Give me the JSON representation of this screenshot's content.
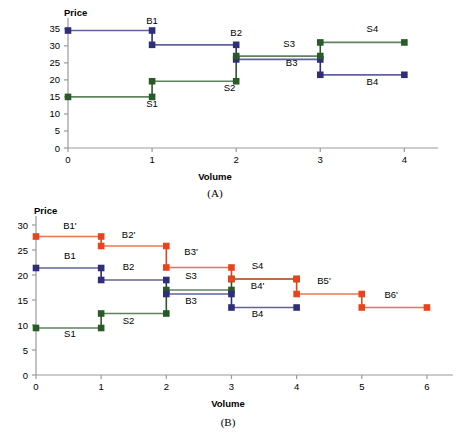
{
  "figure": {
    "title": "",
    "background": "#ffffff",
    "colors": {
      "blue": "#2e2e7a",
      "green": "#2a5a28",
      "orange": "#e8441c",
      "axis": "#9a9a9a",
      "grid_line_light": "#b9b9b9"
    }
  },
  "chart_data": [
    {
      "id": "A",
      "type": "line",
      "caption": "(A)",
      "title": "",
      "xlabel": "Volume",
      "ylabel": "Price",
      "xlim": [
        0,
        4.4
      ],
      "ylim": [
        0,
        37
      ],
      "xticks": [
        0,
        1,
        2,
        3,
        4
      ],
      "yticks": [
        0,
        5,
        10,
        15,
        20,
        25,
        30,
        35
      ],
      "xticklabels": [
        "0",
        "1",
        "2",
        "3",
        "4"
      ],
      "yticklabels": [
        "0",
        "5",
        "10",
        "15",
        "20",
        "25",
        "30",
        "35"
      ],
      "grid": false,
      "legend": "none",
      "series": [
        {
          "name": "B1",
          "color": "#2e2e7a",
          "label": "B1",
          "label_x": 1.0,
          "label_y": 36.5,
          "points": [
            {
              "x": 0,
              "y": 34.5
            },
            {
              "x": 1,
              "y": 34.5
            }
          ]
        },
        {
          "name": "S1",
          "color": "#2a5a28",
          "label": "S1",
          "label_x": 1.0,
          "label_y": 12.0,
          "points": [
            {
              "x": 0,
              "y": 15.0
            },
            {
              "x": 1,
              "y": 15.0
            }
          ]
        },
        {
          "name": "B2",
          "color": "#2e2e7a",
          "label": "B2",
          "label_x": 2.0,
          "label_y": 33.0,
          "points": [
            {
              "x": 1,
              "y": 30.3
            },
            {
              "x": 2,
              "y": 30.3
            }
          ]
        },
        {
          "name": "S2",
          "color": "#2a5a28",
          "label": "S2",
          "label_x": 1.92,
          "label_y": 16.6,
          "points": [
            {
              "x": 1,
              "y": 19.6
            },
            {
              "x": 2,
              "y": 19.6
            }
          ]
        },
        {
          "name": "B3",
          "color": "#2e2e7a",
          "label": "B3",
          "label_x": 2.66,
          "label_y": 24.0,
          "points": [
            {
              "x": 2,
              "y": 26.0
            },
            {
              "x": 3,
              "y": 26.0
            }
          ]
        },
        {
          "name": "S3",
          "color": "#2a5a28",
          "label": "S3",
          "label_x": 2.63,
          "label_y": 29.6,
          "points": [
            {
              "x": 2,
              "y": 27.0
            },
            {
              "x": 3,
              "y": 27.0
            }
          ]
        },
        {
          "name": "B4",
          "color": "#2e2e7a",
          "label": "B4",
          "label_x": 3.62,
          "label_y": 18.6,
          "points": [
            {
              "x": 3,
              "y": 21.5
            },
            {
              "x": 4,
              "y": 21.5
            }
          ]
        },
        {
          "name": "S4",
          "color": "#2a5a28",
          "label": "S4",
          "label_x": 3.62,
          "label_y": 34.0,
          "points": [
            {
              "x": 3,
              "y": 31.0
            },
            {
              "x": 4,
              "y": 31.0
            }
          ]
        }
      ],
      "connectors": [
        {
          "x": 1,
          "y0": 34.5,
          "y1": 30.3,
          "color": "#2e2e7a"
        },
        {
          "x": 1,
          "y0": 19.6,
          "y1": 15.0,
          "color": "#2a5a28"
        },
        {
          "x": 2,
          "y0": 30.3,
          "y1": 26.0,
          "color": "#2e2e7a"
        },
        {
          "x": 2,
          "y0": 27.0,
          "y1": 19.6,
          "color": "#2a5a28"
        },
        {
          "x": 3,
          "y0": 26.0,
          "y1": 21.5,
          "color": "#2e2e7a"
        },
        {
          "x": 3,
          "y0": 31.0,
          "y1": 27.0,
          "color": "#2a5a28"
        }
      ]
    },
    {
      "id": "B",
      "type": "line",
      "caption": "(B)",
      "title": "",
      "xlabel": "Volume",
      "ylabel": "Price",
      "xlim": [
        0,
        6.4
      ],
      "ylim": [
        0,
        31
      ],
      "xticks": [
        0,
        1,
        2,
        3,
        4,
        5,
        6
      ],
      "yticks": [
        0,
        5,
        10,
        15,
        20,
        25,
        30
      ],
      "xticklabels": [
        "0",
        "1",
        "2",
        "3",
        "4",
        "5",
        "6"
      ],
      "yticklabels": [
        "0",
        "5",
        "10",
        "15",
        "20",
        "25",
        "30"
      ],
      "grid": false,
      "legend": "none",
      "series": [
        {
          "name": "B1p",
          "color": "#e8441c",
          "label": "B1'",
          "label_x": 0.52,
          "label_y": 29.3,
          "points": [
            {
              "x": 0,
              "y": 27.7
            },
            {
              "x": 1,
              "y": 27.7
            }
          ]
        },
        {
          "name": "B1",
          "color": "#2e2e7a",
          "label": "B1",
          "label_x": 0.52,
          "label_y": 23.3,
          "points": [
            {
              "x": 0,
              "y": 21.4
            },
            {
              "x": 1,
              "y": 21.4
            }
          ]
        },
        {
          "name": "S1",
          "color": "#2a5a28",
          "label": "S1",
          "label_x": 0.52,
          "label_y": 7.6,
          "points": [
            {
              "x": 0,
              "y": 9.4
            },
            {
              "x": 1,
              "y": 9.4
            }
          ]
        },
        {
          "name": "B2p",
          "color": "#e8441c",
          "label": "B2'",
          "label_x": 1.42,
          "label_y": 27.4,
          "points": [
            {
              "x": 1,
              "y": 25.8
            },
            {
              "x": 2,
              "y": 25.8
            }
          ]
        },
        {
          "name": "B2",
          "color": "#2e2e7a",
          "label": "B2",
          "label_x": 1.42,
          "label_y": 21.0,
          "points": [
            {
              "x": 1,
              "y": 19.0
            },
            {
              "x": 2,
              "y": 19.0
            }
          ]
        },
        {
          "name": "S2",
          "color": "#2a5a28",
          "label": "S2",
          "label_x": 1.42,
          "label_y": 10.3,
          "points": [
            {
              "x": 1,
              "y": 12.3
            },
            {
              "x": 2,
              "y": 12.3
            }
          ]
        },
        {
          "name": "B3p",
          "color": "#e8441c",
          "label": "B3'",
          "label_x": 2.38,
          "label_y": 24.0,
          "points": [
            {
              "x": 2,
              "y": 21.5
            },
            {
              "x": 3,
              "y": 21.5
            }
          ]
        },
        {
          "name": "S3",
          "color": "#2a5a28",
          "label": "S3",
          "label_x": 2.38,
          "label_y": 19.3,
          "points": [
            {
              "x": 2,
              "y": 17.0
            },
            {
              "x": 3,
              "y": 17.0
            }
          ]
        },
        {
          "name": "B3",
          "color": "#2e2e7a",
          "label": "B3",
          "label_x": 2.38,
          "label_y": 14.2,
          "points": [
            {
              "x": 2,
              "y": 16.2
            },
            {
              "x": 3,
              "y": 16.2
            }
          ]
        },
        {
          "name": "S4",
          "color": "#2a5a28",
          "label": "S4",
          "label_x": 3.4,
          "label_y": 21.3,
          "points": [
            {
              "x": 3,
              "y": 19.2
            },
            {
              "x": 4,
              "y": 19.2
            }
          ]
        },
        {
          "name": "B4p",
          "color": "#e8441c",
          "label": "B4'",
          "label_x": 3.4,
          "label_y": 17.2,
          "points": [
            {
              "x": 3,
              "y": 19.2
            },
            {
              "x": 4,
              "y": 19.2
            }
          ]
        },
        {
          "name": "B4",
          "color": "#2e2e7a",
          "label": "B4",
          "label_x": 3.4,
          "label_y": 11.6,
          "points": [
            {
              "x": 3,
              "y": 13.5
            },
            {
              "x": 4,
              "y": 13.5
            }
          ]
        },
        {
          "name": "B5p",
          "color": "#e8441c",
          "label": "B5'",
          "label_x": 4.42,
          "label_y": 18.2,
          "points": [
            {
              "x": 4,
              "y": 16.2
            },
            {
              "x": 5,
              "y": 16.2
            }
          ]
        },
        {
          "name": "B6p",
          "color": "#e8441c",
          "label": "B6'",
          "label_x": 5.45,
          "label_y": 15.5,
          "points": [
            {
              "x": 5,
              "y": 13.5
            },
            {
              "x": 6,
              "y": 13.5
            }
          ]
        }
      ],
      "connectors": [
        {
          "x": 1,
          "y0": 27.7,
          "y1": 25.8,
          "color": "#e8441c"
        },
        {
          "x": 1,
          "y0": 21.4,
          "y1": 19.0,
          "color": "#2e2e7a"
        },
        {
          "x": 1,
          "y0": 12.3,
          "y1": 9.4,
          "color": "#2a5a28"
        },
        {
          "x": 2,
          "y0": 25.8,
          "y1": 21.5,
          "color": "#e8441c"
        },
        {
          "x": 2,
          "y0": 19.0,
          "y1": 16.2,
          "color": "#2e2e7a"
        },
        {
          "x": 2,
          "y0": 17.0,
          "y1": 12.3,
          "color": "#2a5a28"
        },
        {
          "x": 3,
          "y0": 21.5,
          "y1": 19.2,
          "color": "#e8441c"
        },
        {
          "x": 3,
          "y0": 17.0,
          "y1": 19.2,
          "color": "#2a5a28"
        },
        {
          "x": 3,
          "y0": 16.2,
          "y1": 13.5,
          "color": "#2e2e7a"
        },
        {
          "x": 4,
          "y0": 19.2,
          "y1": 16.2,
          "color": "#e8441c"
        },
        {
          "x": 5,
          "y0": 16.2,
          "y1": 13.5,
          "color": "#e8441c"
        }
      ]
    }
  ]
}
